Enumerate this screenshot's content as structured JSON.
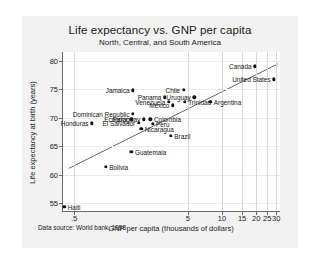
{
  "figure": {
    "title": "Life expectancy vs. GNP per capita",
    "subtitle": "North, Central, and South America",
    "source_note": "Data source: World bank, 1998"
  },
  "chart_data": {
    "type": "scatter",
    "title": "Life expectancy vs. GNP per capita",
    "subtitle": "North, Central, and South America",
    "xlabel": "GNP per capita (thousands of dollars)",
    "ylabel": "Life expectancy at birth (years)",
    "xscale": "log",
    "xlim": [
      0.4,
      33
    ],
    "ylim": [
      53.5,
      81.5
    ],
    "xticks": [
      0.5,
      5,
      10,
      15,
      20,
      25,
      30
    ],
    "xticklabels": [
      ".5",
      "5",
      "10",
      "15",
      "20",
      "25",
      "30"
    ],
    "yticks": [
      55,
      60,
      65,
      70,
      75,
      80
    ],
    "yticklabels": [
      "55",
      "60",
      "65",
      "70",
      "75",
      "80"
    ],
    "grid": true,
    "legend": false,
    "source": "Data source: World bank, 1998",
    "fit_line": {
      "label": "linear fit (log x)",
      "x": [
        0.45,
        31.5
      ],
      "y": [
        61.0,
        79.4
      ]
    },
    "points": [
      {
        "label": "Haiti",
        "x": 0.41,
        "y": 54.4,
        "label_side": "right"
      },
      {
        "label": "Bolivia",
        "x": 0.95,
        "y": 61.4,
        "label_side": "right"
      },
      {
        "label": "Guatemala",
        "x": 1.6,
        "y": 64.0,
        "label_side": "right"
      },
      {
        "label": "Honduras",
        "x": 0.72,
        "y": 69.0,
        "label_side": "left"
      },
      {
        "label": "Nicaragua",
        "x": 1.95,
        "y": 68.1,
        "label_side": "right"
      },
      {
        "label": "El Salvador",
        "x": 1.85,
        "y": 69.1,
        "label_side": "left"
      },
      {
        "label": "Ecuador",
        "x": 1.6,
        "y": 69.7,
        "label_side": "left"
      },
      {
        "label": "Paraguay",
        "x": 2.05,
        "y": 69.7,
        "label_side": "left"
      },
      {
        "label": "Colombia",
        "x": 2.35,
        "y": 69.7,
        "label_side": "right"
      },
      {
        "label": "Peru",
        "x": 2.45,
        "y": 68.9,
        "label_side": "right"
      },
      {
        "label": "Dominican Republic",
        "x": 1.65,
        "y": 70.7,
        "label_side": "left"
      },
      {
        "label": "Brazil",
        "x": 3.55,
        "y": 66.8,
        "label_side": "right"
      },
      {
        "label": "Mexico",
        "x": 3.7,
        "y": 72.2,
        "label_side": "left"
      },
      {
        "label": "Venezuela",
        "x": 3.4,
        "y": 72.8,
        "label_side": "left"
      },
      {
        "label": "Panama",
        "x": 3.15,
        "y": 73.6,
        "label_side": "left"
      },
      {
        "label": "Jamaica",
        "x": 1.65,
        "y": 74.8,
        "label_side": "left"
      },
      {
        "label": "Chile",
        "x": 4.6,
        "y": 74.9,
        "label_side": "left"
      },
      {
        "label": "Uruguay",
        "x": 5.7,
        "y": 73.6,
        "label_side": "left"
      },
      {
        "label": "Trinidad",
        "x": 4.7,
        "y": 72.8,
        "label_side": "right"
      },
      {
        "label": "Argentina",
        "x": 7.9,
        "y": 72.8,
        "label_side": "right"
      },
      {
        "label": "Canada",
        "x": 19.5,
        "y": 79.0,
        "label_side": "left"
      },
      {
        "label": "United States",
        "x": 28.7,
        "y": 76.7,
        "label_side": "left"
      }
    ]
  }
}
